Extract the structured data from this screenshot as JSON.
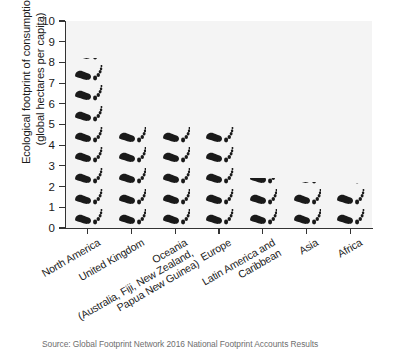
{
  "chart_data": {
    "type": "bar",
    "title": "",
    "subtitle": "",
    "xlabel": "",
    "ylabel": "Ecological footprint of consumption (global hectares per capita)",
    "ylabel_lines": [
      "Ecological footprint of consumption",
      "(global hectares per capita)"
    ],
    "ylim": [
      0,
      10
    ],
    "ytick_step": 1,
    "ytick_labels": [
      "0",
      "1",
      "2",
      "3",
      "4",
      "5",
      "6",
      "7",
      "8",
      "9",
      "10"
    ],
    "grid": false,
    "legend": "none",
    "marker_style": "footprint-pictogram",
    "units": "global hectares per capita",
    "categories": [
      "North America",
      "United Kingdom",
      "Oceania (Australia, Fiji, New Zealand, Papua New Guinea)",
      "Europe",
      "Latin America and Caribbean",
      "Asia",
      "Africa"
    ],
    "category_label_lines": [
      [
        "North America"
      ],
      [
        "United Kingdom"
      ],
      [
        "Oceania",
        "(Australia, Fiji, New Zealand,",
        "Papua New Guinea)"
      ],
      [
        "Europe"
      ],
      [
        "Latin America and",
        "Caribbean"
      ],
      [
        "Asia"
      ],
      [
        "Africa"
      ]
    ],
    "values": [
      8.2,
      4.9,
      4.9,
      4.9,
      2.4,
      2.2,
      2.15
    ],
    "colors": {
      "mark": "#1a1a1a",
      "plot_background": "#f4f4f4",
      "axis": "#333333",
      "page_background": "#ffffff",
      "source_text": "#6e6e6e"
    }
  },
  "source": {
    "note": "Source: Global Footprint Network 2016 National Footprint Accounts Results"
  }
}
